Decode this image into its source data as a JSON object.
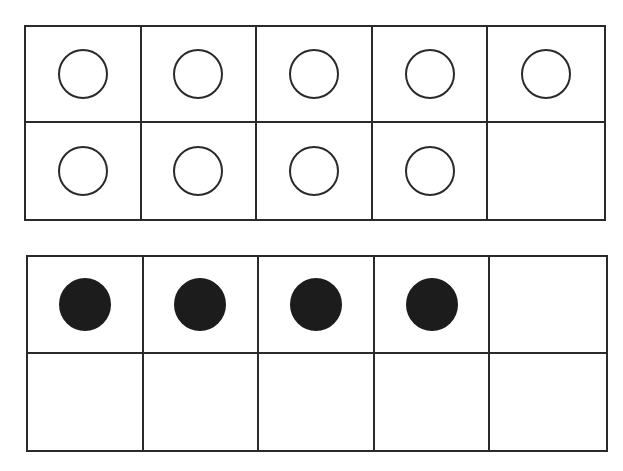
{
  "diagram": {
    "type": "ten-frames",
    "frames": [
      {
        "id": "top",
        "rows": 2,
        "cols": 5,
        "counter_style": "empty",
        "count": 9,
        "cells": [
          [
            "counter",
            "counter",
            "counter",
            "counter",
            "counter"
          ],
          [
            "counter",
            "counter",
            "counter",
            "counter",
            "blank"
          ]
        ]
      },
      {
        "id": "bottom",
        "rows": 2,
        "cols": 5,
        "counter_style": "filled",
        "count": 4,
        "cells": [
          [
            "counter",
            "counter",
            "counter",
            "counter",
            "blank"
          ],
          [
            "blank",
            "blank",
            "blank",
            "blank",
            "blank"
          ]
        ]
      }
    ],
    "colors": {
      "line": "#2a2a2a",
      "filled_counter": "#1c1c1c",
      "background": "#ffffff"
    }
  }
}
